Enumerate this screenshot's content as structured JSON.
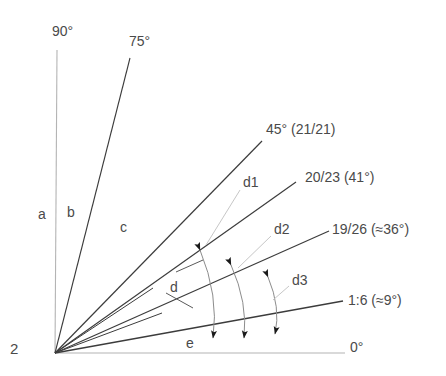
{
  "figure": {
    "corner_number": "2",
    "vertex": {
      "x": 55,
      "y": 353
    },
    "colors": {
      "ray_dark": "#3c3c3c",
      "ray_light": "#b4b4b4",
      "arc": "#8c8c8c",
      "text": "#4a4a4a",
      "background": "#ffffff"
    }
  },
  "rays": [
    {
      "id": "ray-90",
      "label": "90°",
      "angle_deg": 90,
      "tone": "light",
      "end": {
        "x": 57,
        "y": 50
      }
    },
    {
      "id": "ray-75",
      "label": "75°",
      "angle_deg": 75,
      "tone": "dark",
      "end": {
        "x": 130,
        "y": 58
      }
    },
    {
      "id": "ray-45",
      "label": "45° (21/21)",
      "angle_deg": 45,
      "tone": "dark",
      "end": {
        "x": 262,
        "y": 141
      }
    },
    {
      "id": "ray-20-23",
      "label": "20/23 (41°)",
      "angle_deg": 41,
      "tone": "dark",
      "end": {
        "x": 296,
        "y": 182
      }
    },
    {
      "id": "ray-19-26",
      "label": "19/26 (≈36°)",
      "angle_deg": 36,
      "tone": "dark",
      "end": {
        "x": 329,
        "y": 231
      }
    },
    {
      "id": "ray-1-6",
      "label": "1:6 (≈9°)",
      "angle_deg": 9,
      "tone": "dark",
      "end": {
        "x": 343,
        "y": 301
      }
    },
    {
      "id": "ray-0",
      "label": "0°",
      "angle_deg": 0,
      "tone": "light",
      "end": {
        "x": 345,
        "y": 353
      }
    }
  ],
  "minor_rays": [
    {
      "id": "minor-ray-upper",
      "end": {
        "x": 153,
        "y": 288
      }
    },
    {
      "id": "minor-ray-lower",
      "end": {
        "x": 162,
        "y": 313
      }
    }
  ],
  "angle_labels": [
    {
      "id": "label-90",
      "text": "90°",
      "x": 52,
      "y": 24
    },
    {
      "id": "label-75",
      "text": "75°",
      "x": 129,
      "y": 34
    },
    {
      "id": "label-45",
      "text": "45° (21/21)",
      "x": 266,
      "y": 122
    },
    {
      "id": "label-20-23",
      "text": "20/23 (41°)",
      "x": 305,
      "y": 170
    },
    {
      "id": "label-19-26",
      "text": "19/26 (≈36°)",
      "x": 332,
      "y": 222
    },
    {
      "id": "label-1-6",
      "text": "1:6 (≈9°)",
      "x": 348,
      "y": 293
    },
    {
      "id": "label-0",
      "text": "0°",
      "x": 350,
      "y": 340
    }
  ],
  "zone_labels": [
    {
      "id": "zone-a",
      "text": "a",
      "x": 38,
      "y": 207
    },
    {
      "id": "zone-b",
      "text": "b",
      "x": 67,
      "y": 205
    },
    {
      "id": "zone-c",
      "text": "c",
      "x": 120,
      "y": 220
    },
    {
      "id": "zone-d",
      "text": "d",
      "x": 170,
      "y": 280
    },
    {
      "id": "zone-e",
      "text": "e",
      "x": 186,
      "y": 336
    }
  ],
  "dimension_labels": [
    {
      "id": "dim-d1",
      "text": "d1",
      "x": 243,
      "y": 175
    },
    {
      "id": "dim-d2",
      "text": "d2",
      "x": 274,
      "y": 222
    },
    {
      "id": "dim-d3",
      "text": "d3",
      "x": 292,
      "y": 273
    }
  ],
  "dimension_arcs": [
    {
      "id": "arc-d1",
      "from_ray": "ray-45",
      "to_ray": "ray-1-6",
      "label": "d1"
    },
    {
      "id": "arc-d2",
      "from_ray": "ray-20-23",
      "to_ray": "ray-1-6",
      "label": "d2"
    },
    {
      "id": "arc-d3",
      "from_ray": "ray-19-26",
      "to_ray": "ray-1-6",
      "label": "d3"
    }
  ],
  "leader_lines": [
    {
      "id": "leader-d1",
      "label": "d1"
    },
    {
      "id": "leader-d2",
      "label": "d2"
    },
    {
      "id": "leader-d3",
      "label": "d3"
    },
    {
      "id": "leader-d",
      "label": "d"
    }
  ]
}
